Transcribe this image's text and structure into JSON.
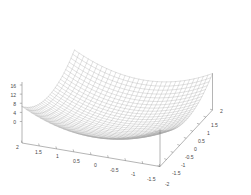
{
  "figure": {
    "kind": "3d-surface-mesh-plot",
    "background_color": "#ffffff",
    "mesh_color": "#a8a8a8",
    "axis_color": "#777777",
    "label_color": "#4a4a4a"
  },
  "chart_data": {
    "type": "line",
    "render_style": "3d-wireframe-surface",
    "title": "",
    "subtitle": "",
    "xlabel": "",
    "ylabel": "",
    "zlabel": "",
    "grid": false,
    "legend": false,
    "legend_position": "none",
    "function": "z = x^2 + y^2 (scaled so corner peaks reach 16)",
    "projection": {
      "view": "isometric-like oblique",
      "x_axis_direction": "toward lower-right-front from left corner",
      "y_axis_direction": "toward upper-right from front corner",
      "z_axis_direction": "vertical at left corner"
    },
    "axes": {
      "x": {
        "min": -2,
        "max": 2,
        "order_on_screen": "2 at left corner decreasing to -2 at front corner",
        "tick_labels": [
          "2",
          "1.5",
          "1",
          "0.5",
          "0",
          "-0.5",
          "-1",
          "-1.5",
          "-2"
        ],
        "tick_values": [
          2,
          1.5,
          1,
          0.5,
          0,
          -0.5,
          -1,
          -1.5,
          -2
        ]
      },
      "y": {
        "min": -2,
        "max": 2,
        "order_on_screen": "-2 at front corner increasing to 2 at right corner",
        "tick_labels": [
          "-2",
          "-1.5",
          "-1",
          "-0.5",
          "0",
          "0.5",
          "1",
          "1.5",
          "2"
        ],
        "tick_values": [
          -2,
          -1.5,
          -1,
          -0.5,
          0,
          0.5,
          1,
          1.5,
          2
        ]
      },
      "z": {
        "min": 0,
        "max": 16,
        "tick_labels": [
          "16",
          "12",
          "8",
          "4",
          "0"
        ],
        "tick_values": [
          16,
          12,
          8,
          4,
          0
        ]
      }
    },
    "mesh": {
      "u_divisions": 30,
      "v_divisions": 30,
      "line_color": "#a8a8a8",
      "line_width": 0.35
    },
    "x": [
      -2,
      -1.5,
      -1,
      -0.5,
      0,
      0.5,
      1,
      1.5,
      2
    ],
    "y": [
      -2,
      -1.5,
      -1,
      -0.5,
      0,
      0.5,
      1,
      1.5,
      2
    ],
    "z_matrix": [
      [
        16,
        12.25,
        10,
        9.25,
        9,
        9.25,
        10,
        12.25,
        16
      ],
      [
        12.25,
        8.5,
        6.25,
        5.5,
        5.25,
        5.5,
        6.25,
        8.5,
        12.25
      ],
      [
        10,
        6.25,
        4,
        3.25,
        3,
        3.25,
        4,
        6.25,
        10
      ],
      [
        9.25,
        5.5,
        3.25,
        2.5,
        2.25,
        2.5,
        3.25,
        5.5,
        9.25
      ],
      [
        9,
        5.25,
        3,
        2.25,
        2,
        2.25,
        3,
        5.25,
        9
      ],
      [
        9.25,
        5.5,
        3.25,
        2.5,
        2.25,
        2.5,
        3.25,
        5.5,
        9.25
      ],
      [
        10,
        6.25,
        4,
        3.25,
        3,
        3.25,
        4,
        6.25,
        10
      ],
      [
        12.25,
        8.5,
        6.25,
        5.5,
        5.25,
        5.5,
        6.25,
        8.5,
        12.25
      ],
      [
        16,
        12.25,
        10,
        9.25,
        9,
        9.25,
        10,
        12.25,
        16
      ]
    ]
  },
  "z_axis": {
    "ticks": [
      {
        "label": "16"
      },
      {
        "label": "12"
      },
      {
        "label": "8"
      },
      {
        "label": "4"
      },
      {
        "label": "0"
      }
    ]
  },
  "x_axis": {
    "ticks": [
      {
        "label": "2"
      },
      {
        "label": "1.5"
      },
      {
        "label": "1"
      },
      {
        "label": "0.5"
      },
      {
        "label": "0"
      },
      {
        "label": "-0.5"
      },
      {
        "label": "-1"
      },
      {
        "label": "-1.5"
      },
      {
        "label": "-2"
      }
    ]
  },
  "y_axis": {
    "ticks": [
      {
        "label": "-1.5"
      },
      {
        "label": "-1"
      },
      {
        "label": "-0.5"
      },
      {
        "label": "0"
      },
      {
        "label": "0.5"
      },
      {
        "label": "1"
      },
      {
        "label": "1.5"
      },
      {
        "label": "2"
      }
    ]
  }
}
